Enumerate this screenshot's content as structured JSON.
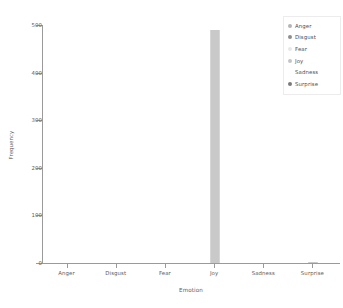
{
  "chart_data": {
    "type": "bar",
    "title": "",
    "xlabel": "Emotion",
    "ylabel": "Frequency",
    "categories": [
      "Anger",
      "Disgust",
      "Fear",
      "Joy",
      "Sadness",
      "Surprise"
    ],
    "values": [
      0,
      0,
      0,
      490,
      0,
      3
    ],
    "ylim": [
      0,
      500
    ],
    "yticks": [
      0,
      100,
      200,
      300,
      400,
      500
    ],
    "ytick_labels": [
      "0",
      "100",
      "200",
      "300",
      "400",
      "500"
    ],
    "grid": false,
    "legend_position": "upper right",
    "series": [
      {
        "name": "Frequency",
        "values": [
          0,
          0,
          0,
          490,
          0,
          3
        ]
      }
    ],
    "legend": [
      {
        "label": "Anger",
        "marker": "circle",
        "color": "#b4b4b4"
      },
      {
        "label": "Disgust",
        "marker": "circle",
        "color": "#8e8e8e"
      },
      {
        "label": "Fear",
        "marker": "circle",
        "color": "#e8e8e8"
      },
      {
        "label": "Joy",
        "marker": "circle",
        "color": "#c4c4c4"
      },
      {
        "label": "Sadness",
        "marker": "none",
        "color": "#ffffff"
      },
      {
        "label": "Surprise",
        "marker": "circle",
        "color": "#7a7a7a"
      }
    ],
    "bar_color": "#c9c9c9",
    "axis_color": "#9a9a9a",
    "text_color": "#5d5d5d",
    "background": "#ffffff"
  }
}
